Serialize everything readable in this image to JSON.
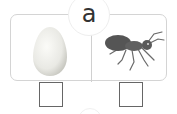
{
  "header": {
    "letter": "a"
  },
  "options": [
    {
      "picture": "egg",
      "icon": "egg-icon",
      "checked": false
    },
    {
      "picture": "ant",
      "icon": "ant-icon",
      "checked": false
    }
  ],
  "colors": {
    "border": "#d4d4d4",
    "checkbox": "#666666",
    "text": "#333333"
  }
}
